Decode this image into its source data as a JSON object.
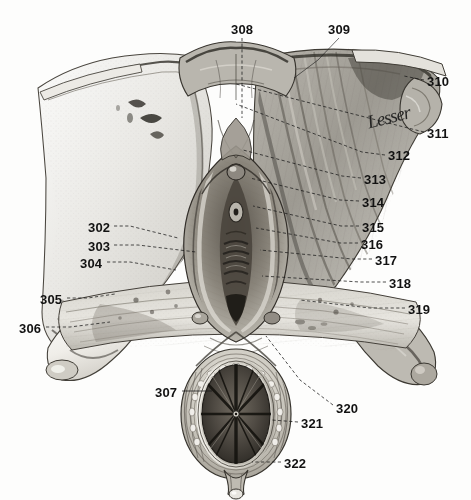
{
  "plate": {
    "kind": "anatomical-engraving",
    "subject": "Dissected perineal region with numbered reference leaders",
    "background_color": "#fdfdfc",
    "ink_color": "#121212",
    "signature_text": "Lesser"
  },
  "labels": [
    {
      "id": "302",
      "text": "302",
      "x": 88,
      "y": 228,
      "side": "left"
    },
    {
      "id": "303",
      "text": "303",
      "x": 88,
      "y": 247,
      "side": "left"
    },
    {
      "id": "304",
      "text": "304",
      "x": 80,
      "y": 264,
      "side": "left"
    },
    {
      "id": "305",
      "text": "305",
      "x": 40,
      "y": 300,
      "side": "left"
    },
    {
      "id": "306",
      "text": "306",
      "x": 19,
      "y": 329,
      "side": "left"
    },
    {
      "id": "307",
      "text": "307",
      "x": 155,
      "y": 393,
      "side": "left"
    },
    {
      "id": "308",
      "text": "308",
      "x": 233,
      "y": 27,
      "side": "top"
    },
    {
      "id": "309",
      "text": "309",
      "x": 330,
      "y": 27,
      "side": "top"
    },
    {
      "id": "310",
      "text": "310",
      "x": 427,
      "y": 82,
      "side": "right"
    },
    {
      "id": "311",
      "text": "311",
      "x": 427,
      "y": 134,
      "side": "right"
    },
    {
      "id": "312",
      "text": "312",
      "x": 388,
      "y": 156,
      "side": "right"
    },
    {
      "id": "313",
      "text": "313",
      "x": 364,
      "y": 180,
      "side": "right"
    },
    {
      "id": "314",
      "text": "314",
      "x": 362,
      "y": 203,
      "side": "right"
    },
    {
      "id": "315",
      "text": "315",
      "x": 362,
      "y": 228,
      "side": "right"
    },
    {
      "id": "316",
      "text": "316",
      "x": 361,
      "y": 245,
      "side": "right"
    },
    {
      "id": "317",
      "text": "317",
      "x": 375,
      "y": 261,
      "side": "right"
    },
    {
      "id": "318",
      "text": "318",
      "x": 389,
      "y": 284,
      "side": "right"
    },
    {
      "id": "319",
      "text": "319",
      "x": 408,
      "y": 310,
      "side": "right"
    },
    {
      "id": "320",
      "text": "320",
      "x": 336,
      "y": 409,
      "side": "right"
    },
    {
      "id": "321",
      "text": "321",
      "x": 301,
      "y": 424,
      "side": "right"
    },
    {
      "id": "322",
      "text": "322",
      "x": 284,
      "y": 464,
      "side": "right"
    }
  ],
  "leaders": [
    {
      "for": "302",
      "points": "114,226 130,226 178,238"
    },
    {
      "for": "303",
      "points": "114,245 138,245 196,252"
    },
    {
      "for": "304",
      "points": "107,262 130,262 176,270"
    },
    {
      "for": "305",
      "points": "67,298 88,298 115,294"
    },
    {
      "for": "306",
      "points": "46,327 70,327 110,322"
    },
    {
      "for": "307",
      "points": "182,391 212,391"
    },
    {
      "for": "308",
      "points": "242,38 242,118"
    },
    {
      "for": "309",
      "points": "339,38 318,60 294,78"
    },
    {
      "for": "310",
      "points": "424,80 404,76"
    },
    {
      "for": "311",
      "points": "424,132 400,126 236,84"
    },
    {
      "for": "312",
      "points": "385,155 362,152 236,104"
    },
    {
      "for": "313",
      "points": "361,178 342,176 243,150"
    },
    {
      "for": "314",
      "points": "359,201 340,200 250,178"
    },
    {
      "for": "315",
      "points": "359,226 341,226 253,206"
    },
    {
      "for": "316",
      "points": "358,243 340,243 256,228"
    },
    {
      "for": "317",
      "points": "372,259 352,259 260,250"
    },
    {
      "for": "318",
      "points": "386,282 360,282 262,276"
    },
    {
      "for": "319",
      "points": "405,308 370,308 300,300"
    },
    {
      "for": "320",
      "points": "333,405 300,380 266,336"
    },
    {
      "for": "321",
      "points": "298,422 272,420"
    },
    {
      "for": "322",
      "points": "281,462 252,462"
    }
  ]
}
